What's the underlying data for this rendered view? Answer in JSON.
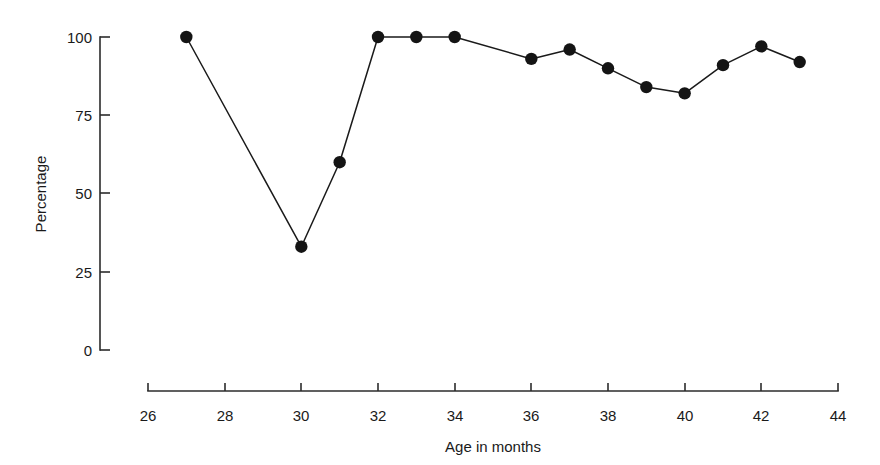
{
  "chart_data": {
    "type": "line",
    "title": "",
    "subtitle": "",
    "xlabel": "Age in months",
    "ylabel": "Percentage",
    "xlim": [
      26,
      44
    ],
    "ylim": [
      0,
      100
    ],
    "xticks": [
      26,
      28,
      30,
      32,
      34,
      36,
      38,
      40,
      42,
      44
    ],
    "xtick_labels": [
      "26",
      "28",
      "30",
      "32",
      "34",
      "36",
      "38",
      "40",
      "42",
      "44"
    ],
    "yticks": [
      0,
      25,
      50,
      75,
      100
    ],
    "ytick_labels": [
      "0",
      "25",
      "50",
      "75",
      "100"
    ],
    "grid": false,
    "legend": false,
    "legend_position": "none",
    "marker": "filled-circle",
    "line_color": "#1a1a1a",
    "marker_color": "#141414",
    "x": [
      27,
      30,
      31,
      32,
      33,
      34,
      36,
      37,
      38,
      39,
      40,
      41,
      42,
      43
    ],
    "values": [
      100,
      33,
      60,
      100,
      100,
      100,
      93,
      96,
      90,
      84,
      82,
      91,
      97,
      92
    ],
    "series": [
      {
        "name": "Percentage",
        "x": [
          27,
          30,
          31,
          32,
          33,
          34,
          36,
          37,
          38,
          39,
          40,
          41,
          42,
          43
        ],
        "values": [
          100,
          33,
          60,
          100,
          100,
          100,
          93,
          96,
          90,
          84,
          82,
          91,
          97,
          92
        ]
      }
    ],
    "annotations": []
  },
  "figure": {
    "background_color": "#ffffff",
    "axis_color": "#2b2b2b"
  }
}
